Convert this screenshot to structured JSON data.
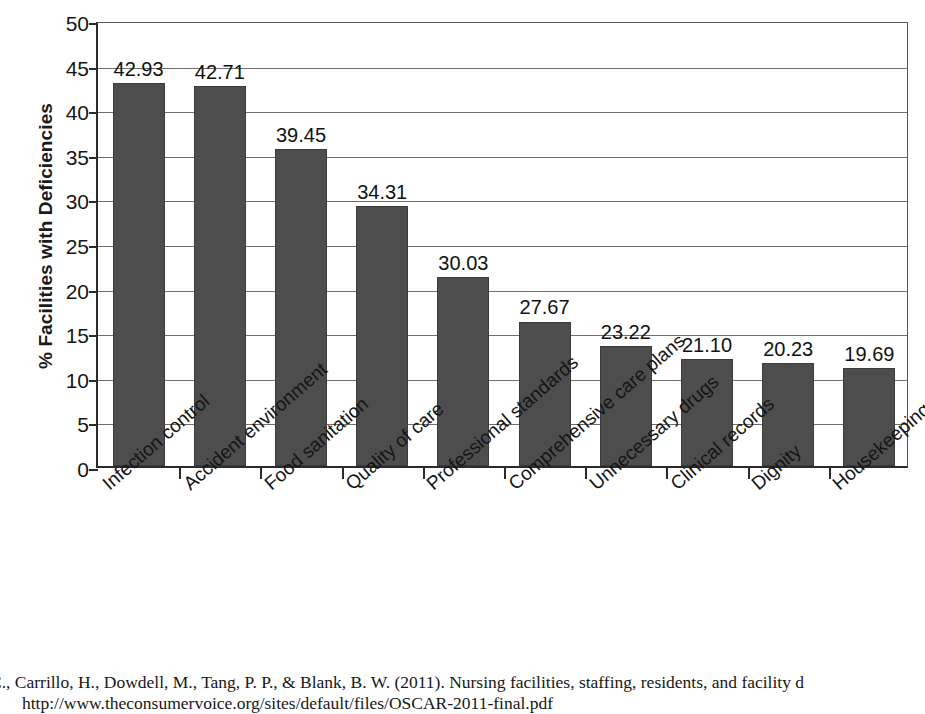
{
  "chart_data": {
    "type": "bar",
    "title": "",
    "xlabel": "",
    "ylabel": "% Facilities with Deficiencies",
    "ylim": [
      0,
      50
    ],
    "yticks": [
      0,
      5,
      10,
      15,
      20,
      25,
      30,
      35,
      40,
      45,
      50
    ],
    "ytick_labels": [
      "0",
      "5",
      "10",
      "15",
      "20",
      "25",
      "30",
      "35",
      "40",
      "45",
      "50"
    ],
    "grid": true,
    "legend": "none",
    "bar_color": "#4d4d4d",
    "categories": [
      "Infection control",
      "Accident environment",
      "Food sanitation",
      "Quality of care",
      "Professional standards",
      "Comprehensive care plans",
      "Unnecessary drugs",
      "Clinical records",
      "Dignity",
      "Housekeeping"
    ],
    "values": [
      42.93,
      42.71,
      39.45,
      34.31,
      30.03,
      27.67,
      23.22,
      21.1,
      20.23,
      19.69
    ],
    "data_labels": [
      "42.93",
      "42.71",
      "39.45",
      "34.31",
      "30.03",
      "27.67",
      "23.22",
      "21.10",
      "20.23",
      "19.69"
    ],
    "drawn_bar_heights": [
      42.9,
      42.6,
      35.5,
      29.2,
      21.2,
      16.2,
      13.4,
      12.0,
      11.6,
      11.0
    ]
  },
  "caption": {
    "line1": "C., Carrillo, H., Dowdell, M., Tang, P. P., & Blank, B. W. (2011). Nursing facilities, staffing, residents, and facility d",
    "line2": "http://www.theconsumervoice.org/sites/default/files/OSCAR-2011-final.pdf"
  }
}
